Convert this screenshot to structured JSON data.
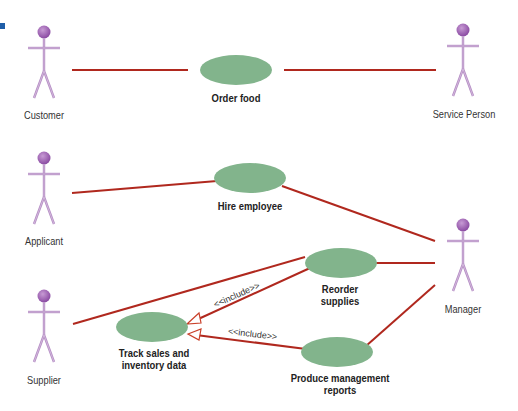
{
  "diagram": {
    "type": "UML use case diagram",
    "colors": {
      "actor": "#a472b8",
      "actor_head": "#9b5aaf",
      "usecase_fill": "#82b48c",
      "association_line": "#b0281e",
      "corner_mark": "#1f5ea8"
    },
    "actors": [
      {
        "id": "customer",
        "label": "Customer"
      },
      {
        "id": "service_person",
        "label": "Service Person"
      },
      {
        "id": "applicant",
        "label": "Applicant"
      },
      {
        "id": "supplier",
        "label": "Supplier"
      },
      {
        "id": "manager",
        "label": "Manager"
      }
    ],
    "use_cases": [
      {
        "id": "order_food",
        "label": "Order food"
      },
      {
        "id": "hire_employee",
        "label": "Hire employee"
      },
      {
        "id": "reorder_supplies",
        "label_line1": "Reorder",
        "label_line2": "supplies"
      },
      {
        "id": "track_sales",
        "label_line1": "Track sales and",
        "label_line2": "inventory data"
      },
      {
        "id": "produce_reports",
        "label_line1": "Produce management",
        "label_line2": "reports"
      }
    ],
    "associations": [
      {
        "from": "customer",
        "to": "order_food"
      },
      {
        "from": "order_food",
        "to": "service_person"
      },
      {
        "from": "applicant",
        "to": "hire_employee"
      },
      {
        "from": "hire_employee",
        "to": "manager"
      },
      {
        "from": "reorder_supplies",
        "to": "manager"
      },
      {
        "from": "produce_reports",
        "to": "manager"
      },
      {
        "from": "supplier",
        "to": "reorder_supplies"
      }
    ],
    "includes": [
      {
        "from": "reorder_supplies",
        "to": "track_sales",
        "label": "<<include>>"
      },
      {
        "from": "produce_reports",
        "to": "track_sales",
        "label": "<<include>>"
      }
    ]
  }
}
